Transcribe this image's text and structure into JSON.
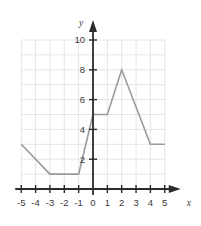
{
  "chart_data": {
    "type": "line",
    "title": "",
    "xlabel": "x",
    "ylabel": "y",
    "xlim": [
      -5,
      5
    ],
    "ylim": [
      0,
      10
    ],
    "grid": true,
    "legend_position": "none",
    "x_ticks": [
      -5,
      -4,
      -3,
      -2,
      -1,
      0,
      1,
      2,
      3,
      4,
      5
    ],
    "x_tick_labels": [
      "-5",
      "-4",
      "-3",
      "-2",
      "-1",
      "0",
      "1",
      "2",
      "3",
      "4",
      "5"
    ],
    "y_ticks": [
      2,
      4,
      6,
      8,
      10
    ],
    "y_tick_labels": [
      "2",
      "4",
      "6",
      "8",
      "10"
    ],
    "series": [
      {
        "name": "f",
        "color": "#9a9a9a",
        "x": [
          -5,
          -3,
          -1,
          0,
          1,
          2,
          4,
          5
        ],
        "values": [
          3,
          1,
          1,
          5,
          5,
          8,
          3,
          3
        ],
        "points": [
          {
            "x": -5,
            "y": 3
          },
          {
            "x": -3,
            "y": 1
          },
          {
            "x": -1,
            "y": 1
          },
          {
            "x": 0,
            "y": 5
          },
          {
            "x": 1,
            "y": 5
          },
          {
            "x": 2,
            "y": 8
          },
          {
            "x": 4,
            "y": 3
          },
          {
            "x": 5,
            "y": 3
          }
        ]
      }
    ],
    "colors": {
      "line": "#9a9a9a",
      "grid": "#e8e4e4",
      "axis": "#2b2b2b",
      "tick_label": "#3a3a3a",
      "background": "#ffffff"
    }
  }
}
